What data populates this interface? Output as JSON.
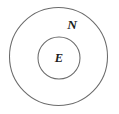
{
  "canvas": {
    "width": 119,
    "height": 114,
    "background_color": "#ffffff"
  },
  "diagram": {
    "type": "nested-set-euler-diagram",
    "stroke_color": "#6b6b6b",
    "label_color": "#1c1c1c",
    "outer_set": {
      "label": "N",
      "center_x": 58.5,
      "center_y": 56.5,
      "radius": 49,
      "label_x": 72,
      "label_y": 26
    },
    "inner_set": {
      "label": "E",
      "center_x": 59,
      "center_y": 58,
      "radius": 21,
      "label_x": 59,
      "label_y": 59
    }
  }
}
